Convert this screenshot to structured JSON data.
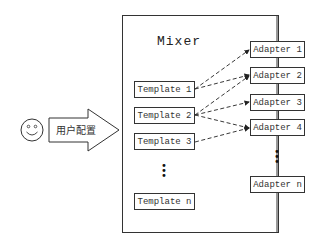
{
  "diagram": {
    "mixer": {
      "title": "Mixer"
    },
    "user": {
      "icon": "smiley-face-icon",
      "input_label": "用户配置"
    },
    "templates": [
      {
        "label": "Template 1"
      },
      {
        "label": "Template 2"
      },
      {
        "label": "Template 3"
      },
      {
        "label": "Template n"
      }
    ],
    "adapters": [
      {
        "label": "Adapter 1"
      },
      {
        "label": "Adapter 2"
      },
      {
        "label": "Adapter 3"
      },
      {
        "label": "Adapter 4"
      },
      {
        "label": "Adapter n"
      }
    ],
    "ellipsis": "⋮",
    "connections": [
      {
        "from": "Template 1",
        "to": "Adapter 1",
        "style": "dashed"
      },
      {
        "from": "Template 1",
        "to": "Adapter 2",
        "style": "dashed"
      },
      {
        "from": "Template 2",
        "to": "Adapter 2",
        "style": "dashed"
      },
      {
        "from": "Template 2",
        "to": "Adapter 3",
        "style": "dashed"
      },
      {
        "from": "Template 2",
        "to": "Adapter 4",
        "style": "dashed"
      },
      {
        "from": "Template 3",
        "to": "Adapter 4",
        "style": "dashed"
      }
    ],
    "colors": {
      "stroke": "#333333",
      "background": "#ffffff"
    }
  }
}
